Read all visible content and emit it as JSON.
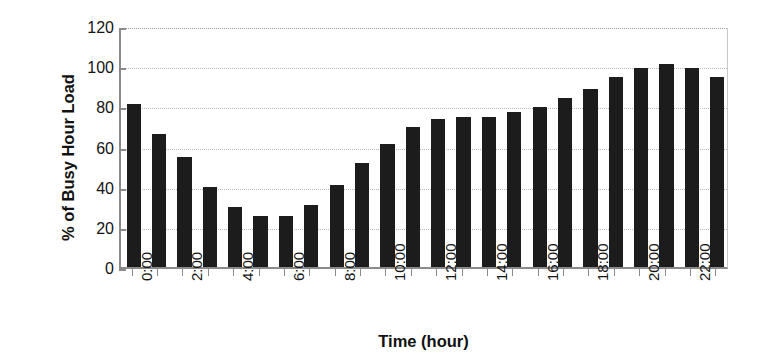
{
  "chart_data": {
    "type": "bar",
    "title": "",
    "subtitle": "",
    "xlabel": "Time (hour)",
    "ylabel": "% of Busy Hour Load",
    "ylim": [
      0,
      120
    ],
    "ytick_values": [
      0,
      20,
      40,
      60,
      80,
      100,
      120
    ],
    "ytick_labels": [
      "0",
      "20",
      "40",
      "60",
      "80",
      "100",
      "120"
    ],
    "grid": true,
    "grid_axis": "y",
    "legend": null,
    "legend_position": "none",
    "bar_color": "#1c1c1c",
    "categories": [
      "0:00",
      "1:00",
      "2:00",
      "3:00",
      "4:00",
      "5:00",
      "6:00",
      "7:00",
      "8:00",
      "9:00",
      "10:00",
      "11:00",
      "12:00",
      "13:00",
      "14:00",
      "15:00",
      "16:00",
      "17:00",
      "18:00",
      "19:00",
      "20:00",
      "21:00",
      "22:00",
      "23:00"
    ],
    "xtick_labels_shown": [
      "0:00",
      "",
      "2:00",
      "",
      "4:00",
      "",
      "6:00",
      "",
      "8:00",
      "",
      "10:00",
      "",
      "12:00",
      "",
      "14:00",
      "",
      "16:00",
      "",
      "18:00",
      "",
      "20:00",
      "",
      "22:00",
      ""
    ],
    "values": [
      81,
      66,
      55,
      40,
      30,
      25.5,
      25.5,
      31,
      41,
      52,
      61.5,
      69.5,
      73.5,
      74.5,
      74.5,
      77,
      79.5,
      84,
      88.5,
      94.5,
      99,
      101,
      99,
      94.5
    ]
  }
}
